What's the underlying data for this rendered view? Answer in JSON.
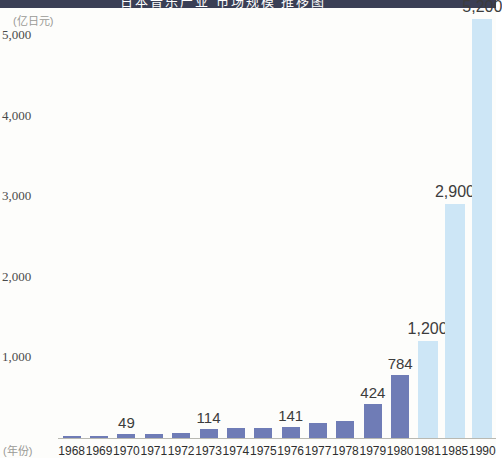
{
  "header": {
    "strip_text": "日本音乐产业 市场规模 推移图"
  },
  "chart_data": {
    "type": "bar",
    "title": "",
    "xlabel": "(年份)",
    "ylabel": "(亿日元)",
    "y_unit_label": "(亿日元)",
    "x_unit_label": "(年份)",
    "categories": [
      "1968",
      "1969",
      "1970",
      "1971",
      "1972",
      "1973",
      "1974",
      "1975",
      "1976",
      "1977",
      "1978",
      "1979",
      "1980",
      "1981",
      "1985",
      "1990"
    ],
    "values": [
      10,
      22,
      49,
      52,
      60,
      114,
      120,
      128,
      141,
      180,
      210,
      424,
      784,
      1200,
      2900,
      5200
    ],
    "point_labels": [
      "",
      "",
      "49",
      "",
      "",
      "114",
      "",
      "",
      "141",
      "",
      "",
      "424",
      "784",
      "1,200",
      "2,900",
      "5,200"
    ],
    "bar_styles": [
      "dark",
      "dark",
      "dark",
      "dark",
      "dark",
      "dark",
      "dark",
      "dark",
      "dark",
      "dark",
      "dark",
      "dark",
      "dark",
      "light",
      "light",
      "light"
    ],
    "colors": {
      "bar_dark": "#6f7cb6",
      "bar_light": "#cde6f6",
      "axis": "#b9b9b2",
      "label_text": "#3c3c3c",
      "header_strip": "#3a3f55",
      "background": "#fdfdfb"
    },
    "yticks": [
      {
        "value": 5000,
        "label": "5,000"
      },
      {
        "value": 4000,
        "label": "4,000"
      },
      {
        "value": 3000,
        "label": "3,000"
      },
      {
        "value": 2000,
        "label": "2,000"
      },
      {
        "value": 1000,
        "label": "1,000"
      }
    ],
    "ylim": [
      0,
      5400
    ],
    "grid": false,
    "legend": "none"
  }
}
